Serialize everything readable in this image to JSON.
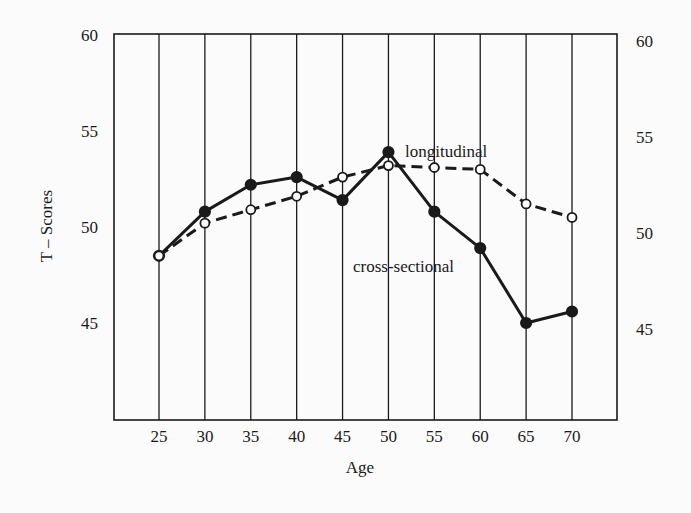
{
  "chart_data": {
    "type": "line",
    "title": "",
    "xlabel": "Age",
    "ylabel": "T – Scores",
    "x": [
      25,
      30,
      35,
      40,
      45,
      50,
      55,
      60,
      65,
      70
    ],
    "ylim": [
      40,
      60
    ],
    "yticks_left": [
      45,
      50,
      55,
      60
    ],
    "yticks_right": [
      45,
      50,
      55,
      60
    ],
    "grid": "vertical lines at each age tick",
    "legend": "inline annotations",
    "series": [
      {
        "name": "cross-sectional",
        "style": "solid line, filled circle markers",
        "values": [
          48.5,
          50.8,
          52.2,
          52.6,
          51.4,
          53.9,
          50.8,
          48.9,
          45.0,
          45.6
        ]
      },
      {
        "name": "longitudinal",
        "style": "dashed line, open circle markers",
        "values": [
          48.5,
          50.2,
          50.9,
          51.6,
          52.6,
          53.2,
          53.1,
          53.0,
          51.2,
          50.5
        ]
      }
    ],
    "annotations": [
      {
        "text": "longitudinal",
        "near_x": 55,
        "near_y": 54.6
      },
      {
        "text": "cross-sectional",
        "near_x": 50,
        "near_y": 48.5
      }
    ]
  },
  "labels": {
    "xlabel": "Age",
    "ylabel": "T – Scores",
    "longitudinal": "longitudinal",
    "cross_sectional": "cross-sectional"
  }
}
